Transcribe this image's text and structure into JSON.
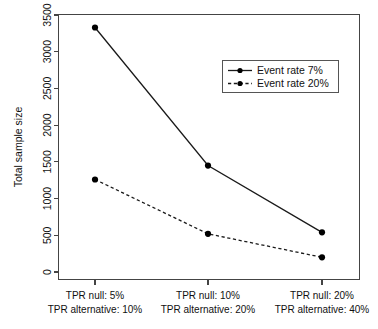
{
  "chart_data": {
    "type": "line",
    "title": "",
    "subtitle": "",
    "xlabel": "",
    "ylabel": "Total sample size",
    "ylim": [
      0,
      3500
    ],
    "yticks": [
      0,
      500,
      1000,
      1500,
      2000,
      2500,
      3000,
      3500
    ],
    "ytick_labels": [
      "0",
      "500",
      "1000",
      "1500",
      "2000",
      "2500",
      "3000",
      "3500"
    ],
    "grid": false,
    "legend_position": "upper right",
    "categories": [
      "TPR null: 5%\nTPR alternative: 10%",
      "TPR null: 10%\nTPR alternative: 20%",
      "TPR null: 20%\nTPR alternative: 40%"
    ],
    "category_lines": [
      {
        "line1": "TPR null: 5%",
        "line2": "TPR alternative: 10%"
      },
      {
        "line1": "TPR null: 10%",
        "line2": "TPR alternative: 20%"
      },
      {
        "line1": "TPR null: 20%",
        "line2": "TPR alternative: 40%"
      }
    ],
    "series": [
      {
        "name": "Event rate 7%",
        "values": [
          3330,
          1450,
          540
        ],
        "linestyle": "solid",
        "marker": "circle",
        "color": "#000000"
      },
      {
        "name": "Event rate 20%",
        "values": [
          1260,
          520,
          200
        ],
        "linestyle": "dashed",
        "marker": "circle",
        "color": "#000000"
      }
    ]
  },
  "legend": {
    "entries": [
      {
        "label": "Event rate 7%",
        "style": "solid"
      },
      {
        "label": "Event rate 20%",
        "style": "dashed"
      }
    ]
  },
  "axes": {
    "y_title": "Total sample size",
    "y_tick_labels": [
      "0",
      "500",
      "1000",
      "1500",
      "2000",
      "2500",
      "3000",
      "3500"
    ],
    "x_tick_labels_top": [
      "TPR null: 5%",
      "TPR null: 10%",
      "TPR null: 20%"
    ],
    "x_tick_labels_bottom": [
      "TPR alternative: 10%",
      "TPR alternative: 20%",
      "TPR alternative: 40%"
    ]
  },
  "colors": {
    "series": "#000000",
    "axis": "#444444",
    "background": "#ffffff"
  }
}
